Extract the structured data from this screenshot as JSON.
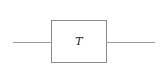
{
  "diagram": {
    "type": "block-diagram",
    "blocks": [
      {
        "id": "T",
        "label": "T"
      }
    ],
    "edges": [
      {
        "from": "input",
        "to": "T"
      },
      {
        "from": "T",
        "to": "output"
      }
    ],
    "colors": {
      "line": "#9a9a9a",
      "border": "#8a8a8a",
      "text": "#222222",
      "background": "#ffffff"
    }
  }
}
